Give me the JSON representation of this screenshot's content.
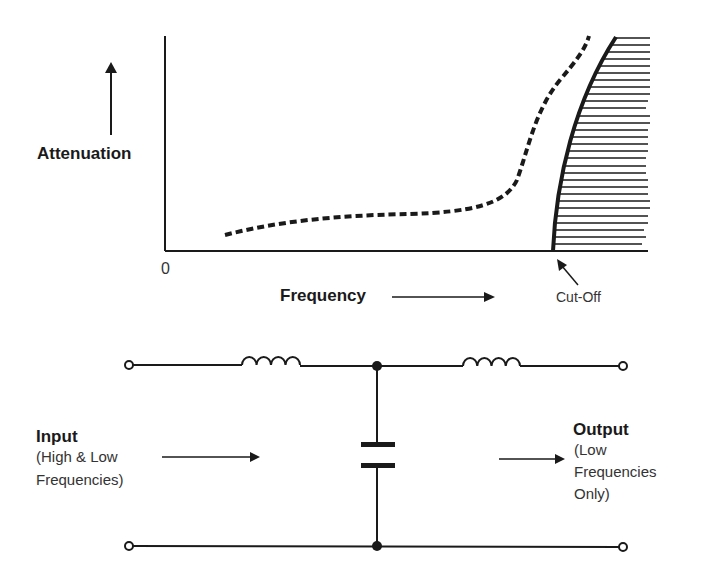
{
  "graph": {
    "y_axis_label": "Attenuation",
    "x_axis_label": "Frequency",
    "origin_label": "0",
    "cutoff_label": "Cut-Off"
  },
  "circuit": {
    "input_title": "Input",
    "input_desc_line1": "(High & Low",
    "input_desc_line2": "Frequencies)",
    "output_title": "Output",
    "output_desc_line1": "(Low",
    "output_desc_line2": "Frequencies",
    "output_desc_line3": "Only)"
  },
  "colors": {
    "ink": "#1a1a1a",
    "background": "#ffffff"
  }
}
